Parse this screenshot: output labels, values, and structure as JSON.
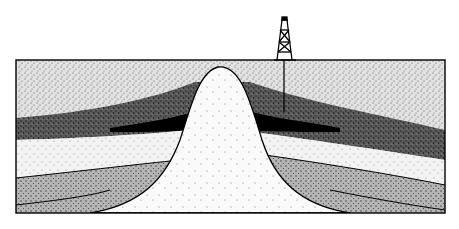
{
  "diagram": {
    "title": "Salt dome oil trap cross-section",
    "elements": {
      "derrick": "oil-derrick",
      "well": "drill-well",
      "dome": "salt-dome",
      "trap": "oil-trap"
    },
    "layers": [
      {
        "name": "overburden",
        "shade": "light-stipple"
      },
      {
        "name": "reservoir-rock",
        "shade": "dark-stipple"
      },
      {
        "name": "oil-accumulation",
        "shade": "black"
      },
      {
        "name": "lower-sand",
        "shade": "sparse-stipple"
      },
      {
        "name": "lower-layer",
        "shade": "medium-stipple"
      },
      {
        "name": "basal-layer",
        "shade": "light-stipple"
      }
    ],
    "colors": {
      "ink": "#000000",
      "paper": "#ffffff"
    }
  }
}
